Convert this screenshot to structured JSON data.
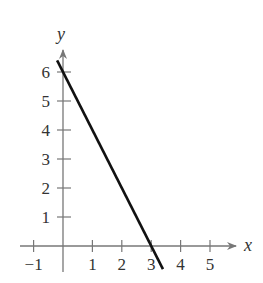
{
  "chart_data": {
    "type": "line",
    "title": "",
    "xlabel": "x",
    "ylabel": "y",
    "xlim": [
      -1.2,
      6.2
    ],
    "ylim": [
      0,
      6.6
    ],
    "grid": false,
    "x_ticks": [
      -1,
      1,
      2,
      3,
      4,
      5
    ],
    "y_ticks": [
      1,
      2,
      3,
      4,
      5,
      6
    ],
    "x_tick_labels": [
      "−1",
      "1",
      "2",
      "3",
      "4",
      "5"
    ],
    "y_tick_labels": [
      "1",
      "2",
      "3",
      "4",
      "5",
      "6"
    ],
    "series": [
      {
        "name": "y = -2x + 6",
        "x": [
          -0.2,
          3.4
        ],
        "y": [
          6.4,
          -0.8
        ]
      }
    ],
    "colors": {
      "line": "#111111",
      "axis": "#777777",
      "text": "#333333"
    }
  }
}
